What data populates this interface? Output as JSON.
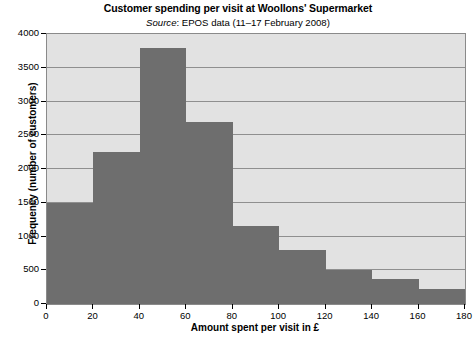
{
  "chart_data": {
    "type": "bar",
    "title": "Customer spending per visit at Woollons' Supermarket",
    "subtitle_source_word": "Source",
    "subtitle_rest": ": EPOS data (11–17 February 2008)",
    "subtitle_full": "Source: EPOS data (11–17 February 2008)",
    "xlabel": "Amount spent per visit in £",
    "ylabel": "Frequency (number of customers)",
    "xlim": [
      0,
      180
    ],
    "ylim": [
      0,
      4000
    ],
    "grid": true,
    "legend": "none",
    "bar_color": "#6e6e6e",
    "plot_background": "#e2e2e2",
    "gridline_color": "#8f8f8f",
    "xticks": [
      0,
      20,
      40,
      60,
      80,
      100,
      120,
      140,
      160,
      180
    ],
    "yticks": [
      0,
      500,
      1000,
      1500,
      2000,
      2500,
      3000,
      3500,
      4000
    ],
    "bin_edges": [
      0,
      20,
      40,
      60,
      80,
      100,
      120,
      140,
      160,
      180
    ],
    "categories": [
      "0–20",
      "20–40",
      "40–60",
      "60–80",
      "80–100",
      "100–120",
      "120–140",
      "140–160",
      "160–180"
    ],
    "values": [
      1500,
      2250,
      3800,
      2700,
      1150,
      800,
      500,
      375,
      225
    ]
  }
}
